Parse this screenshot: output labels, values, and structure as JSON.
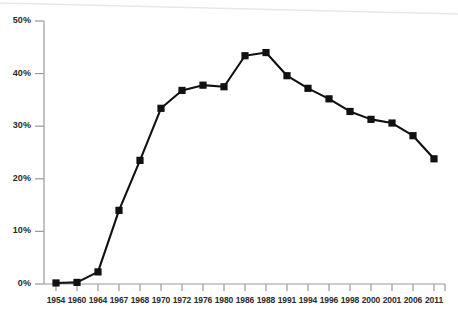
{
  "chart_data": {
    "type": "line",
    "title": "",
    "subtitle": "",
    "xlabel": "",
    "ylabel": "",
    "grid": false,
    "legend": null,
    "legend_position": "none",
    "marker": "square",
    "line_color": "#111111",
    "marker_color": "#111111",
    "axis_color": "#9a9a9a",
    "label_color": "#2b2b2b",
    "categories": [
      "1954",
      "1960",
      "1964",
      "1967",
      "1968",
      "1970",
      "1972",
      "1976",
      "1980",
      "1986",
      "1988",
      "1991",
      "1994",
      "1996",
      "1998",
      "2000",
      "2001",
      "2006",
      "2011"
    ],
    "values": [
      0.2,
      0.3,
      2.3,
      14.0,
      23.5,
      33.4,
      36.8,
      37.8,
      37.5,
      43.4,
      44.0,
      39.6,
      37.2,
      35.2,
      32.8,
      31.3,
      30.6,
      28.2,
      23.8
    ],
    "ylim": [
      0,
      50
    ],
    "ytick_values": [
      0,
      10,
      20,
      30,
      40,
      50
    ],
    "ytick_labels": [
      "0%",
      "10%",
      "20%",
      "30%",
      "40%",
      "50%"
    ]
  }
}
